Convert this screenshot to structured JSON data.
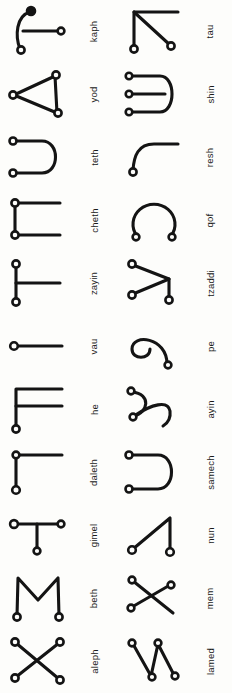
{
  "page": {
    "background_color": "#fdfdfb",
    "ink_color": "#141414",
    "columns": 2,
    "rows_per_column": 11,
    "total_glyphs": 22
  },
  "columns": [
    {
      "name": "left-column",
      "entries": [
        {
          "label": "kaph",
          "shape": "arc-with-horizontal-stem",
          "nodes": 3,
          "node_styles": [
            "solid",
            "open",
            "open"
          ]
        },
        {
          "label": "yod",
          "shape": "triangle",
          "nodes": 3,
          "node_styles": [
            "open",
            "open",
            "open"
          ]
        },
        {
          "label": "teth",
          "shape": "rotated-u-two-prong",
          "nodes": 2,
          "node_styles": [
            "open",
            "open"
          ]
        },
        {
          "label": "cheth",
          "shape": "bracket-two-prong",
          "nodes": 2,
          "node_styles": [
            "open",
            "open"
          ]
        },
        {
          "label": "zayin",
          "shape": "vertical-with-mid-branch",
          "nodes": 2,
          "node_styles": [
            "open",
            "open"
          ]
        },
        {
          "label": "vau",
          "shape": "horizontal-line",
          "nodes": 1,
          "node_styles": [
            "open"
          ]
        },
        {
          "label": "he",
          "shape": "e-bracket-extended",
          "nodes": 1,
          "node_styles": [
            "open"
          ]
        },
        {
          "label": "daleth",
          "shape": "rotated-l",
          "nodes": 2,
          "node_styles": [
            "open",
            "open"
          ]
        },
        {
          "label": "gimel",
          "shape": "t-shape",
          "nodes": 3,
          "node_styles": [
            "open",
            "open",
            "open"
          ]
        },
        {
          "label": "beth",
          "shape": "m-shape",
          "nodes": 2,
          "node_styles": [
            "open",
            "open"
          ]
        },
        {
          "label": "aleph",
          "shape": "x-shape",
          "nodes": 4,
          "node_styles": [
            "open",
            "open",
            "open",
            "open"
          ]
        }
      ]
    },
    {
      "name": "right-column",
      "entries": [
        {
          "label": "tau",
          "shape": "corner-with-diagonal",
          "nodes": 2,
          "node_styles": [
            "open",
            "open"
          ]
        },
        {
          "label": "shin",
          "shape": "rotated-u-three-prong",
          "nodes": 3,
          "node_styles": [
            "open",
            "open",
            "open"
          ]
        },
        {
          "label": "resh",
          "shape": "hook-curve",
          "nodes": 1,
          "node_styles": [
            "open"
          ]
        },
        {
          "label": "qof",
          "shape": "open-circle",
          "nodes": 2,
          "node_styles": [
            "open",
            "open"
          ]
        },
        {
          "label": "tzaddi",
          "shape": "y-diagonal-fork",
          "nodes": 3,
          "node_styles": [
            "open",
            "open",
            "open"
          ]
        },
        {
          "label": "pe",
          "shape": "spiral",
          "nodes": 1,
          "node_styles": [
            "open"
          ]
        },
        {
          "label": "ayin",
          "shape": "double-hook",
          "nodes": 2,
          "node_styles": [
            "open",
            "open"
          ]
        },
        {
          "label": "samech",
          "shape": "rotated-u-two-prong",
          "nodes": 2,
          "node_styles": [
            "open",
            "open"
          ]
        },
        {
          "label": "nun",
          "shape": "triangle-open-diagonal",
          "nodes": 2,
          "node_styles": [
            "open",
            "open"
          ]
        },
        {
          "label": "mem",
          "shape": "crossed-diagonals",
          "nodes": 2,
          "node_styles": [
            "open",
            "open"
          ]
        },
        {
          "label": "lamed",
          "shape": "zigzag-w",
          "nodes": 4,
          "node_styles": [
            "open",
            "open",
            "open",
            "open"
          ]
        }
      ]
    }
  ]
}
